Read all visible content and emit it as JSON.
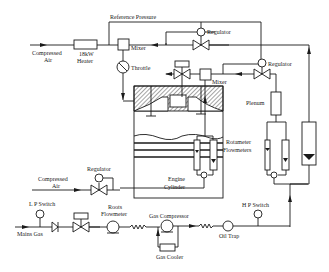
{
  "diagram": {
    "type": "process-flow-schematic",
    "labels": {
      "reference_pressure": "Reference Pressure",
      "compressed_air_top_1": "Compressed",
      "compressed_air_top_2": "Air",
      "heater_1": "18kW",
      "heater_2": "Heater",
      "mixer_top": "Mixer",
      "throttle": "Throttle",
      "regulator_top": "Regulator",
      "mixer_mid": "Mixer",
      "regulator_right": "Regulator",
      "plenum": "Plenum",
      "rotameter_1": "Rotameter",
      "rotameter_2": "Flowmeters",
      "engine_1": "Engine",
      "engine_2": "Cylinder",
      "compressed_air_mid_1": "Compressed",
      "compressed_air_mid_2": "Air",
      "regulator_left": "Regulator",
      "lp_switch": "L P Switch",
      "mains_gas": "Mains Gas",
      "roots_1": "Roots",
      "roots_2": "Flowmeter",
      "gas_compressor": "Gas Compressor",
      "gas_cooler": "Gas Cooler",
      "oil_trap": "Oil Trap",
      "hp_switch": "H P Switch"
    },
    "components": [
      {
        "id": "heater",
        "label": "18kW Heater"
      },
      {
        "id": "mixer-air",
        "label": "Mixer"
      },
      {
        "id": "throttle",
        "label": "Throttle"
      },
      {
        "id": "regulator-top",
        "label": "Regulator"
      },
      {
        "id": "mixer-gas",
        "label": "Mixer"
      },
      {
        "id": "regulator-right",
        "label": "Regulator"
      },
      {
        "id": "plenum",
        "label": "Plenum"
      },
      {
        "id": "rotameters",
        "label": "Rotameter Flowmeters"
      },
      {
        "id": "engine-cylinder",
        "label": "Engine Cylinder"
      },
      {
        "id": "regulator-left",
        "label": "Regulator"
      },
      {
        "id": "lp-switch",
        "label": "L P Switch"
      },
      {
        "id": "roots-flowmeter",
        "label": "Roots Flowmeter"
      },
      {
        "id": "gas-compressor",
        "label": "Gas Compressor"
      },
      {
        "id": "gas-cooler",
        "label": "Gas Cooler"
      },
      {
        "id": "oil-trap",
        "label": "Oil Trap"
      },
      {
        "id": "hp-switch",
        "label": "H P Switch"
      }
    ]
  }
}
